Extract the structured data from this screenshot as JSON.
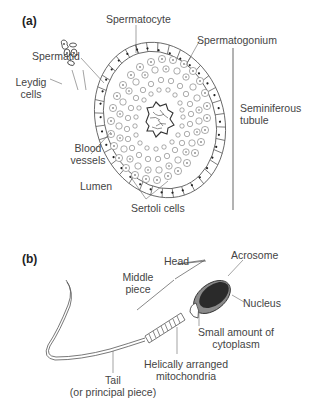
{
  "panel_a": {
    "label": "(a)",
    "title_hidden": "Cross-section of seminiferous tubule",
    "labels": {
      "spermatocyte": "Spermatocyte",
      "spermatogonium": "Spermatogonium",
      "spermatid": "Spermatid",
      "leydig_line1": "Leydig",
      "leydig_line2": "cells",
      "blood_line1": "Blood",
      "blood_line2": "vessels",
      "lumen": "Lumen",
      "sertoli": "Sertoli cells",
      "seminiferous_line1": "Seminiferous",
      "seminiferous_line2": "tubule"
    }
  },
  "panel_b": {
    "label": "(b)",
    "labels": {
      "head": "Head",
      "middle_line1": "Middle",
      "middle_line2": "piece",
      "acrosome": "Acrosome",
      "nucleus": "Nucleus",
      "cytoplasm_line1": "Small amount of",
      "cytoplasm_line2": "cytoplasm",
      "mito_line1": "Helically arranged",
      "mito_line2": "mitochondria",
      "tail_line1": "Tail",
      "tail_line2": "(or principal piece)"
    }
  },
  "colors": {
    "line": "#555555",
    "nucleus_fill": "#2a2a2a",
    "acrosome_fill": "#8a8a8a",
    "background": "#ffffff"
  }
}
